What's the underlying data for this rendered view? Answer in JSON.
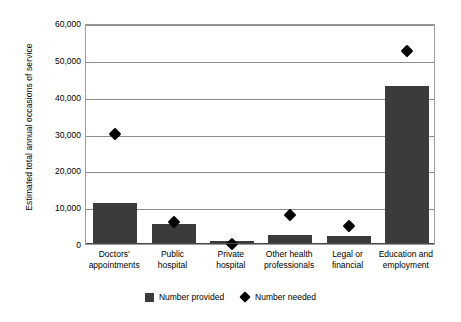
{
  "chart_data": {
    "type": "bar",
    "title": "",
    "subtitle": "",
    "xlabel": "",
    "ylabel": "Estimated total annual occasions of service",
    "ylim": [
      0,
      60000
    ],
    "ytick_labels": [
      "60,000",
      "50,000",
      "40,000",
      "30,000",
      "20,000",
      "10,000",
      "0"
    ],
    "ytick_values": [
      60000,
      50000,
      40000,
      30000,
      20000,
      10000,
      0
    ],
    "grid": true,
    "legend_position": "bottom",
    "categories": [
      "Doctors' appointments",
      "Public hospital",
      "Private hospital",
      "Other health professionals",
      "Legal or financial",
      "Education and employment"
    ],
    "category_lines": [
      [
        "Doctors'",
        "appointments"
      ],
      [
        "Public",
        "hospital"
      ],
      [
        "Private",
        "hospital"
      ],
      [
        "Other health",
        "professionals"
      ],
      [
        "Legal or",
        "financial"
      ],
      [
        "Education and",
        "employment"
      ]
    ],
    "series": [
      {
        "name": "Number provided",
        "type": "bar",
        "color": "#3b3b3b",
        "values": [
          10800,
          5100,
          600,
          2200,
          1900,
          42500
        ]
      },
      {
        "name": "Number needed",
        "type": "marker",
        "marker": "diamond",
        "color": "#000000",
        "values": [
          31000,
          7200,
          1300,
          9200,
          6200,
          53500
        ]
      }
    ]
  },
  "legend": {
    "items": [
      {
        "label": "Number provided",
        "icon": "square-swatch"
      },
      {
        "label": "Number needed",
        "icon": "diamond-swatch"
      }
    ]
  }
}
